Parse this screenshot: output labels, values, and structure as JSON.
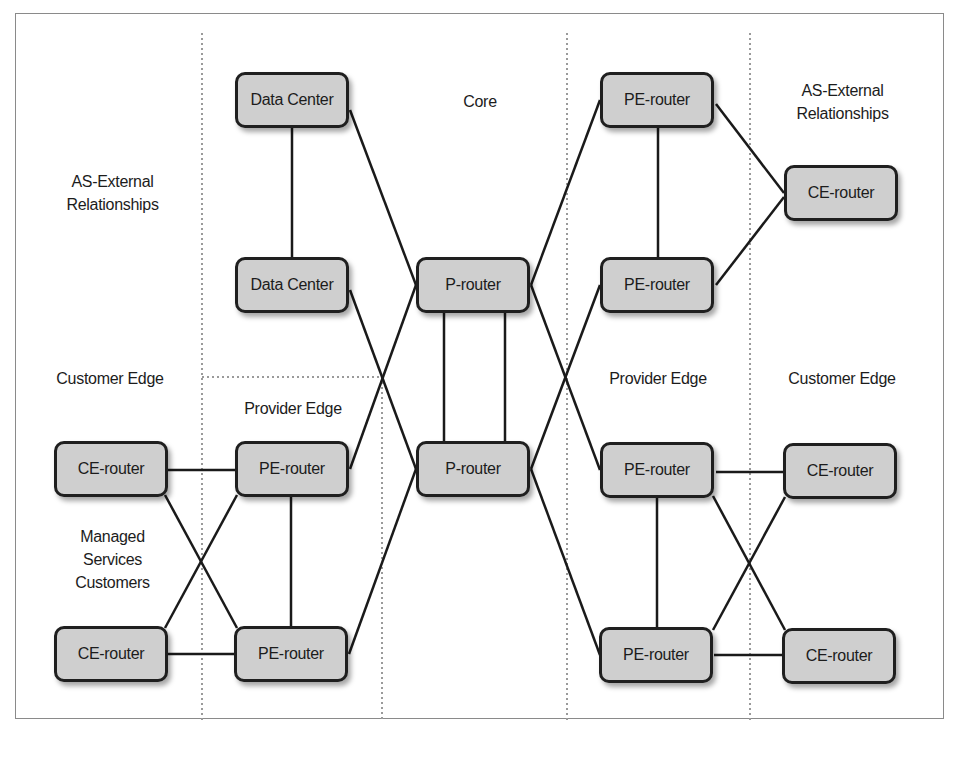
{
  "diagram": {
    "zones": {
      "left_upper": "AS-External Relationships",
      "left_upper_lines": [
        "AS-External",
        "Relationships"
      ],
      "left_lower": "Customer Edge",
      "managed": "Managed Services Customers",
      "managed_lines": [
        "Managed",
        "Services",
        "Customers"
      ],
      "provider_edge_left": "Provider Edge",
      "core": "Core",
      "provider_edge_right": "Provider Edge",
      "right_upper_lines": [
        "AS-External",
        "Relationships"
      ],
      "right_lower": "Customer Edge"
    },
    "nodes": {
      "dc1": "Data Center",
      "dc2": "Data Center",
      "p1": "P-router",
      "p2": "P-router",
      "pe_tr1": "PE-router",
      "pe_tr2": "PE-router",
      "ce_tr": "CE-router",
      "ce_l1": "CE-router",
      "ce_l2": "CE-router",
      "pe_l1": "PE-router",
      "pe_l2": "PE-router",
      "pe_r1": "PE-router",
      "pe_r2": "PE-router",
      "ce_r1": "CE-router",
      "ce_r2": "CE-router"
    },
    "links": [
      [
        "dc1",
        "dc2"
      ],
      [
        "dc1",
        "p1"
      ],
      [
        "dc2",
        "p2"
      ],
      [
        "p1",
        "p2"
      ],
      [
        "p1",
        "p2"
      ],
      [
        "p1",
        "pe_tr1"
      ],
      [
        "p1",
        "pe_r1"
      ],
      [
        "p1",
        "pe_l1"
      ],
      [
        "p2",
        "pe_tr2"
      ],
      [
        "p2",
        "pe_r2"
      ],
      [
        "p2",
        "pe_l2"
      ],
      [
        "pe_tr1",
        "pe_tr2"
      ],
      [
        "pe_tr1",
        "ce_tr"
      ],
      [
        "pe_tr2",
        "ce_tr"
      ],
      [
        "ce_l1",
        "pe_l1"
      ],
      [
        "ce_l1",
        "pe_l2"
      ],
      [
        "ce_l2",
        "pe_l1"
      ],
      [
        "ce_l2",
        "pe_l2"
      ],
      [
        "pe_l1",
        "pe_l2"
      ],
      [
        "pe_r1",
        "ce_r1"
      ],
      [
        "pe_r1",
        "ce_r2"
      ],
      [
        "pe_r2",
        "ce_r1"
      ],
      [
        "pe_r2",
        "ce_r2"
      ],
      [
        "pe_r1",
        "pe_r2"
      ]
    ],
    "colors": {
      "node_fill": "#cfcfcf",
      "node_border": "#1f1f1f",
      "link": "#1a1a1a",
      "divider": "#9a9a9a"
    }
  }
}
